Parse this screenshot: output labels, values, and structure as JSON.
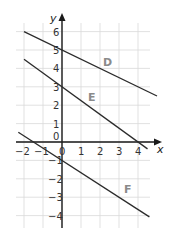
{
  "chart_data": {
    "type": "line",
    "title": "",
    "xlabel": "x",
    "ylabel": "y",
    "xlim": [
      -2.4,
      4.8
    ],
    "ylim": [
      -4.5,
      6.5
    ],
    "grid": true,
    "x_ticks": [
      "−2",
      "−1",
      "0",
      "1",
      "2",
      "3",
      "4"
    ],
    "y_ticks": [
      "6",
      "5",
      "4",
      "3",
      "2",
      "1",
      "0",
      "−1",
      "−2",
      "−3",
      "−4"
    ],
    "series": [
      {
        "name": "D",
        "equation": "y = 5 − 0.5x",
        "points": [
          [
            -2,
            6
          ],
          [
            5,
            2.5
          ]
        ]
      },
      {
        "name": "E",
        "equation": "y = 3 − 0.75x",
        "points": [
          [
            -2,
            4.5
          ],
          [
            4.5,
            -0.375
          ]
        ]
      },
      {
        "name": "F",
        "equation": "y = −1 − (2/3)x",
        "points": [
          [
            -2.3,
            0.53
          ],
          [
            4.6,
            -4.07
          ]
        ]
      }
    ],
    "legend": "inline labels D, E, F",
    "label_color": "#8a8a8a"
  },
  "labels": {
    "x_axis": "x",
    "y_axis": "y",
    "line_d": "D",
    "line_e": "E",
    "line_f": "F"
  }
}
